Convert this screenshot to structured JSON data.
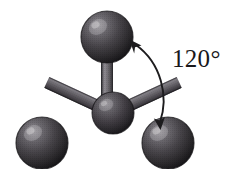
{
  "figure": {
    "kind": "ball-and-stick-molecular-model",
    "geometry_name": "trigonal planar",
    "background_color": "#ffffff",
    "width": 244,
    "height": 169
  },
  "annotation": {
    "angle_label": "120°",
    "angle_value": 120,
    "angle_unit": "degrees",
    "arrow_style": "double-headed-curved",
    "arrow_color": "#1d1c1e"
  },
  "palette": {
    "atom_dark": "#2f2d30",
    "atom_mid": "#4a474b",
    "atom_light": "#7d7a7e",
    "atom_highlight": "#a9a6aa",
    "atom_shadow": "#141315",
    "atom_outline": "#171618",
    "bond_dark": "#56535a",
    "bond_light": "#9b989f",
    "bond_outline": "#2a282c",
    "label_color": "#19181a"
  },
  "atoms": [
    {
      "id": "center",
      "role": "central-atom",
      "cx": 113,
      "cy": 113,
      "r": 21
    },
    {
      "id": "top",
      "role": "terminal-atom",
      "cx": 107,
      "cy": 37,
      "r": 26
    },
    {
      "id": "bottom-left",
      "role": "terminal-atom",
      "cx": 42,
      "cy": 143,
      "r": 26
    },
    {
      "id": "bottom-right",
      "role": "terminal-atom",
      "cx": 168,
      "cy": 143,
      "r": 26
    }
  ],
  "bonds": [
    {
      "id": "bond-center-top",
      "from": "center",
      "to": "top",
      "width": 12
    },
    {
      "id": "bond-center-bottom-left",
      "from": "center",
      "to": "bottom-left",
      "width": 12
    },
    {
      "id": "bond-center-bottom-right",
      "from": "center",
      "to": "bottom-right",
      "width": 12
    }
  ],
  "arrow": {
    "path": "M 134 44 C 160 62, 168 95, 159 124",
    "head_start": {
      "x": 134,
      "y": 44,
      "angle": -145
    },
    "head_end": {
      "x": 159,
      "y": 124,
      "angle": 104
    }
  },
  "label_position": {
    "left": 172,
    "top": 46
  }
}
